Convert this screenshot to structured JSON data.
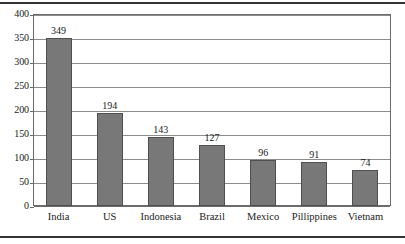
{
  "chart_data": {
    "type": "bar",
    "title": "",
    "subtitle": "",
    "xlabel": "",
    "ylabel": "",
    "categories": [
      "India",
      "US",
      "Indonesia",
      "Brazil",
      "Mexico",
      "Pillippines",
      "Vietnam"
    ],
    "values": [
      349,
      194,
      143,
      127,
      96,
      91,
      74
    ],
    "value_labels": [
      "349",
      "194",
      "143",
      "127",
      "96",
      "91",
      "74"
    ],
    "ylim": [
      0,
      400
    ],
    "ytick_values": [
      0,
      50,
      100,
      150,
      200,
      250,
      300,
      350,
      400
    ],
    "ytick_labels": [
      "0",
      "50",
      "100",
      "150",
      "200",
      "250",
      "300",
      "350",
      "400"
    ],
    "grid": "horizontal",
    "legend": "none",
    "orientation": "vertical",
    "bar_color": "#787878",
    "bar_edge_color": "#4f4f4f",
    "gridline_color": "#8c8c8c",
    "frame_color": "#6b6b6b",
    "rule_color": "#333333",
    "text_color": "#1a1a1a",
    "background_color": "#ffffff"
  }
}
